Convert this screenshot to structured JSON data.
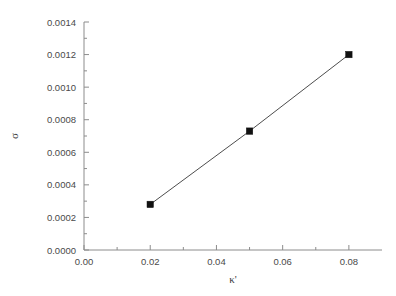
{
  "chart_data": {
    "type": "line",
    "title": "",
    "subtitle": "",
    "xlabel": "κ'",
    "ylabel": "σ",
    "xlim": [
      0.0,
      0.09
    ],
    "ylim": [
      0.0,
      0.0014
    ],
    "grid": false,
    "legend": null,
    "x": [
      0.02,
      0.05,
      0.08
    ],
    "series": [
      {
        "name": "sigma vs kappa",
        "marker": "filled-square",
        "line_color": "#4d4d4d",
        "marker_color": "#111111",
        "values": [
          0.00028,
          0.00073,
          0.0012
        ]
      }
    ],
    "xticks": [
      0.0,
      0.02,
      0.04,
      0.06,
      0.08
    ],
    "xtick_labels": [
      "0.00",
      "0.02",
      "0.04",
      "0.06",
      "0.08"
    ],
    "xminor_ticks": [
      0.01,
      0.03,
      0.05,
      0.07
    ],
    "yticks": [
      0.0,
      0.0002,
      0.0004,
      0.0006,
      0.0008,
      0.001,
      0.0012,
      0.0014
    ],
    "ytick_labels": [
      "0.0000",
      "0.0002",
      "0.0004",
      "0.0006",
      "0.0008",
      "0.0010",
      "0.0012",
      "0.0014"
    ],
    "yminor_ticks": [
      0.0001,
      0.0003,
      0.0005,
      0.0007,
      0.0009,
      0.0011,
      0.0013
    ],
    "annotations": []
  },
  "style": {
    "background": "#ffffff",
    "axis_color": "#8c8c8c",
    "text_color": "#4a4a4a",
    "line_color": "#4d4d4d",
    "marker_color": "#111111"
  }
}
